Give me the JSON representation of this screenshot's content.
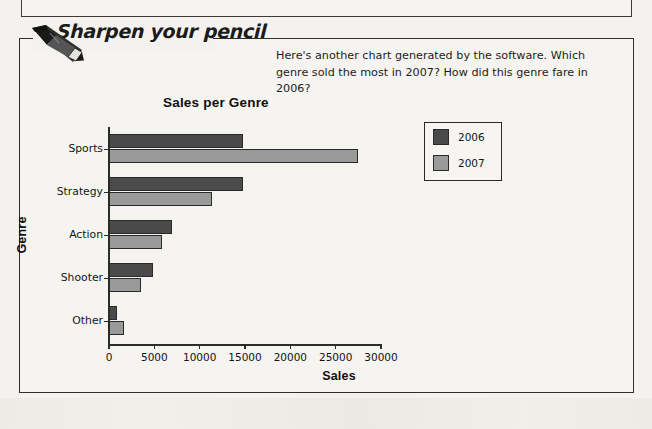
{
  "header": {
    "title": "Sharpen your pencil",
    "pencil_icon": "pencil-icon"
  },
  "prompt": {
    "text": "Here's another chart generated by the software. Which genre sold the most in 2007? How did this genre fare in 2006?"
  },
  "colors": {
    "series_2006": "#4a4a4a",
    "series_2007": "#9a9a9a",
    "axis": "#2b2b2b",
    "page_background": "#f4f2ee",
    "box_background": "#f6f4f0"
  },
  "chart_data": {
    "type": "bar",
    "orientation": "horizontal",
    "title": "Sales per Genre",
    "xlabel": "Sales",
    "ylabel": "Genre",
    "categories": [
      "Sports",
      "Strategy",
      "Action",
      "Shooter",
      "Other"
    ],
    "series": [
      {
        "name": "2006",
        "color": "#4a4a4a",
        "values": [
          14800,
          14800,
          7000,
          4900,
          900
        ]
      },
      {
        "name": "2007",
        "color": "#9a9a9a",
        "values": [
          27500,
          11400,
          5900,
          3500,
          1700
        ]
      }
    ],
    "xlim": [
      0,
      30000
    ],
    "xticks": [
      0,
      5000,
      10000,
      15000,
      20000,
      25000,
      30000
    ],
    "xtick_labels": [
      "0",
      "5000",
      "10000",
      "15000",
      "20000",
      "25000",
      "30000"
    ],
    "grid": false,
    "legend_position": "right",
    "legend_entries": [
      "2006",
      "2007"
    ]
  }
}
